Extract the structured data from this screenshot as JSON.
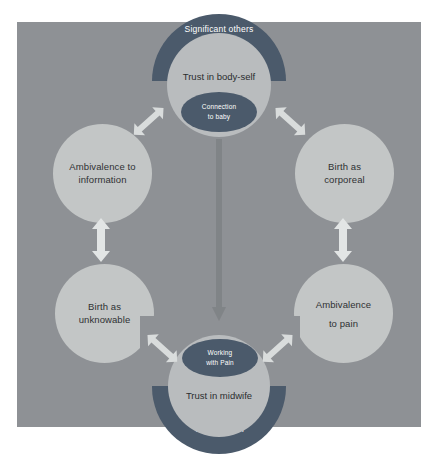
{
  "figure": {
    "type": "cyclical-concept-diagram",
    "background_color": "#8e9195",
    "accent_dark": "#4b5a6b",
    "node_fill": "#c3c6c6",
    "arrow_color": "#d9dcdc"
  },
  "arcs": [
    {
      "id": "significant-others",
      "label": "Significant others",
      "position": "top",
      "color": "#4b5a6b"
    },
    {
      "id": "trust-in-birth",
      "label": "Trust in birth",
      "position": "bottom",
      "color": "#4b5a6b"
    }
  ],
  "hub_circles": [
    {
      "id": "trust-in-body-self",
      "label": "Trust in body-self",
      "position": "top-center"
    },
    {
      "id": "trust-in-midwife",
      "label": "Trust in midwife",
      "position": "bottom-center"
    }
  ],
  "inner_ellipses": [
    {
      "id": "connection-to-baby",
      "line1": "Connection",
      "line2": "to baby",
      "position": "top-center"
    },
    {
      "id": "working-with-pain",
      "line1": "Working",
      "line2": "with Pain",
      "position": "bottom-center"
    }
  ],
  "outer_circles": [
    {
      "id": "ambivalence-to-information",
      "line1": "Ambivalence to",
      "line2": "information",
      "position": "top-left"
    },
    {
      "id": "birth-as-corporeal",
      "line1": "Birth as",
      "line2": "corporeal",
      "position": "top-right"
    },
    {
      "id": "birth-as-unknowable",
      "line1": "Birth as",
      "line2": "unknowable",
      "position": "bottom-left"
    },
    {
      "id": "ambivalence-to-pain",
      "line1": "Ambivalence",
      "line2": "to pain",
      "position": "bottom-right"
    }
  ],
  "connectors": [
    {
      "id": "arrow-body-self-to-information",
      "kind": "double-diagonal"
    },
    {
      "id": "arrow-body-self-to-corporeal",
      "kind": "double-diagonal"
    },
    {
      "id": "arrow-information-to-unknowable",
      "kind": "double-vertical"
    },
    {
      "id": "arrow-corporeal-to-pain",
      "kind": "double-vertical"
    },
    {
      "id": "arrow-unknowable-to-midwife",
      "kind": "double-diagonal"
    },
    {
      "id": "arrow-pain-to-midwife",
      "kind": "double-diagonal"
    },
    {
      "id": "arrow-center-downward",
      "kind": "single-vertical"
    }
  ]
}
